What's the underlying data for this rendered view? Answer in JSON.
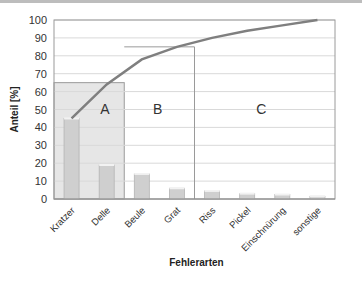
{
  "chart_data": {
    "type": "bar",
    "title": "",
    "xlabel": "Fehlerarten",
    "ylabel": "Anteil [%]",
    "ylim": [
      0,
      100
    ],
    "yticks": [
      0,
      10,
      20,
      30,
      40,
      50,
      60,
      70,
      80,
      90,
      100
    ],
    "grid": true,
    "categories": [
      "Kratzer",
      "Delle",
      "Beule",
      "Grat",
      "Riss",
      "Pickel",
      "Einschnürung",
      "sonstige"
    ],
    "series": [
      {
        "name": "Anteil",
        "type": "bar",
        "values": [
          45,
          19,
          14,
          6,
          4.5,
          3,
          2.5,
          1.5
        ]
      },
      {
        "name": "Kumuliert",
        "type": "line",
        "values": [
          45,
          64,
          78,
          85,
          90,
          94,
          97,
          100
        ]
      }
    ],
    "regions": [
      {
        "label": "A",
        "x_end_category": "Delle",
        "top": 65
      },
      {
        "label": "B",
        "x_end_category": "Grat",
        "top": 85
      },
      {
        "label": "C",
        "x_end_category": "sonstige",
        "top": 100
      }
    ],
    "colors": {
      "bar": "#cfcfcf",
      "line": "#7f7f7f",
      "region_a": "#e6e6e6",
      "grid": "#d9d9d9"
    }
  }
}
